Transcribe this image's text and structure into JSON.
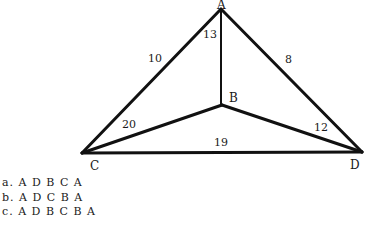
{
  "graph": {
    "vertices": [
      {
        "id": "A",
        "label": "A",
        "x": 221,
        "y": 8
      },
      {
        "id": "B",
        "label": "B",
        "x": 222,
        "y": 105
      },
      {
        "id": "C",
        "label": "C",
        "x": 82,
        "y": 153
      },
      {
        "id": "D",
        "label": "D",
        "x": 362,
        "y": 152
      }
    ],
    "edges": [
      {
        "from": "A",
        "to": "C",
        "weight": "10"
      },
      {
        "from": "A",
        "to": "B",
        "weight": "13"
      },
      {
        "from": "A",
        "to": "D",
        "weight": "8"
      },
      {
        "from": "B",
        "to": "C",
        "weight": "20"
      },
      {
        "from": "B",
        "to": "D",
        "weight": "12"
      },
      {
        "from": "C",
        "to": "D",
        "weight": "19"
      }
    ]
  },
  "options": [
    {
      "letter": "a.",
      "path": "A D B C A"
    },
    {
      "letter": "b.",
      "path": "A D C B A"
    },
    {
      "letter": "c.",
      "path": "A D B C B A"
    }
  ]
}
